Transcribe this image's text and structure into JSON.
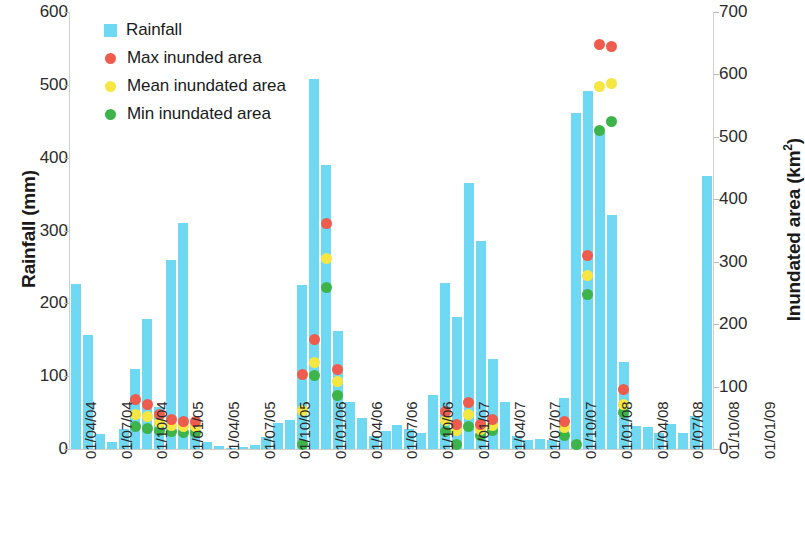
{
  "chart_data": {
    "type": "bar",
    "title": "",
    "xlabel": "",
    "ylabel": "Rainfall (mm)",
    "y2label": "Inundated area (km²)",
    "ylim": [
      0,
      600
    ],
    "y2lim": [
      0,
      700
    ],
    "grid": false,
    "legend_position": "top-left",
    "y_ticks": [
      0,
      100,
      200,
      300,
      400,
      500,
      600
    ],
    "y2_ticks": [
      0,
      100,
      200,
      300,
      400,
      500,
      600,
      700
    ],
    "x_tick_labels": [
      "01/04/04",
      "01/07/04",
      "01/10/04",
      "01/01/05",
      "01/04/05",
      "01/07/05",
      "01/10/05",
      "01/01/06",
      "01/04/06",
      "01/07/06",
      "01/10/06",
      "01/01/07",
      "01/04/07",
      "01/07/07",
      "01/10/07",
      "01/01/08",
      "01/04/08",
      "01/07/08",
      "01/10/08",
      "01/01/09"
    ],
    "x_tick_index": [
      0,
      3,
      6,
      9,
      12,
      15,
      18,
      21,
      24,
      27,
      30,
      33,
      36,
      39,
      42,
      45,
      48,
      51,
      54,
      57
    ],
    "legend": [
      {
        "label": "Rainfall",
        "color": "#6fd8f2",
        "marker": "square"
      },
      {
        "label": "Max inunded area",
        "color": "#ef5b4c",
        "marker": "circle"
      },
      {
        "label": "Mean inundated area",
        "color": "#f5e642",
        "marker": "circle"
      },
      {
        "label": "Min inundated area",
        "color": "#3cb44a",
        "marker": "circle"
      }
    ],
    "series": [
      {
        "name": "Rainfall",
        "unit": "mm",
        "axis": "left",
        "color": "#6fd8f2",
        "values": [
          226,
          156,
          20,
          9,
          28,
          110,
          178,
          58,
          260,
          310,
          36,
          9,
          4,
          2,
          3,
          5,
          17,
          36,
          40,
          225,
          508,
          390,
          162,
          65,
          43,
          18,
          25,
          33,
          27,
          22,
          74,
          228,
          181,
          365,
          285,
          124,
          65,
          18,
          12,
          14,
          12,
          70,
          462,
          492,
          435,
          321,
          120,
          32,
          30,
          22,
          35,
          22,
          45,
          375
        ]
      },
      {
        "name": "Max inundated area",
        "unit": "km²",
        "axis": "right",
        "color": "#ef5b4c",
        "points": [
          {
            "i": 5,
            "v": 79
          },
          {
            "i": 6,
            "v": 72
          },
          {
            "i": 7,
            "v": 55
          },
          {
            "i": 8,
            "v": 47
          },
          {
            "i": 9,
            "v": 44
          },
          {
            "i": 10,
            "v": 44
          },
          {
            "i": 19,
            "v": 120
          },
          {
            "i": 20,
            "v": 175
          },
          {
            "i": 21,
            "v": 362
          },
          {
            "i": 22,
            "v": 128
          },
          {
            "i": 31,
            "v": 60
          },
          {
            "i": 32,
            "v": 40
          },
          {
            "i": 33,
            "v": 75
          },
          {
            "i": 34,
            "v": 40
          },
          {
            "i": 35,
            "v": 47
          },
          {
            "i": 41,
            "v": 44
          },
          {
            "i": 43,
            "v": 310
          },
          {
            "i": 44,
            "v": 648
          },
          {
            "i": 45,
            "v": 645
          },
          {
            "i": 46,
            "v": 95
          }
        ]
      },
      {
        "name": "Mean inundated area",
        "unit": "km²",
        "axis": "right",
        "color": "#f5e642",
        "points": [
          {
            "i": 5,
            "v": 56
          },
          {
            "i": 6,
            "v": 52
          },
          {
            "i": 7,
            "v": 42
          },
          {
            "i": 8,
            "v": 38
          },
          {
            "i": 9,
            "v": 36
          },
          {
            "i": 10,
            "v": 36
          },
          {
            "i": 19,
            "v": 62
          },
          {
            "i": 20,
            "v": 138
          },
          {
            "i": 21,
            "v": 305
          },
          {
            "i": 22,
            "v": 108
          },
          {
            "i": 31,
            "v": 45
          },
          {
            "i": 32,
            "v": 30
          },
          {
            "i": 33,
            "v": 55
          },
          {
            "i": 34,
            "v": 32
          },
          {
            "i": 35,
            "v": 38
          },
          {
            "i": 41,
            "v": 34
          },
          {
            "i": 43,
            "v": 278
          },
          {
            "i": 44,
            "v": 580
          },
          {
            "i": 45,
            "v": 585
          },
          {
            "i": 46,
            "v": 72
          }
        ]
      },
      {
        "name": "Min inundated area",
        "unit": "km²",
        "axis": "right",
        "color": "#3cb44a",
        "points": [
          {
            "i": 5,
            "v": 36
          },
          {
            "i": 6,
            "v": 33
          },
          {
            "i": 7,
            "v": 30
          },
          {
            "i": 8,
            "v": 28
          },
          {
            "i": 9,
            "v": 26
          },
          {
            "i": 10,
            "v": 26
          },
          {
            "i": 19,
            "v": 8
          },
          {
            "i": 20,
            "v": 118
          },
          {
            "i": 21,
            "v": 258
          },
          {
            "i": 22,
            "v": 85
          },
          {
            "i": 31,
            "v": 28
          },
          {
            "i": 32,
            "v": 7
          },
          {
            "i": 33,
            "v": 36
          },
          {
            "i": 34,
            "v": 22
          },
          {
            "i": 35,
            "v": 30
          },
          {
            "i": 41,
            "v": 22
          },
          {
            "i": 42,
            "v": 7
          },
          {
            "i": 43,
            "v": 248
          },
          {
            "i": 44,
            "v": 510
          },
          {
            "i": 45,
            "v": 525
          },
          {
            "i": 46,
            "v": 58
          }
        ]
      }
    ]
  }
}
